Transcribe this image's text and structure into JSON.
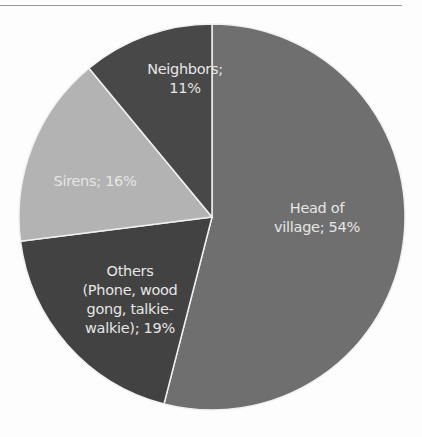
{
  "chart_data": {
    "type": "pie",
    "title": "",
    "categories": [
      "Head of village",
      "Others (Phone, wood gong, talkie-walkie)",
      "Sirens",
      "Neighbors"
    ],
    "values": [
      54,
      19,
      16,
      11
    ],
    "unit": "%",
    "colors": [
      "#6f6f6f",
      "#424242",
      "#b3b3b3",
      "#484848"
    ],
    "start_angle_deg": 0,
    "direction": "clockwise",
    "legend": "none",
    "data_labels": [
      "Head of village; 54%",
      "Others (Phone, wood gong, talkie-walkie); 19%",
      "Sirens; 16%",
      "Neighbors; 11%"
    ]
  },
  "labels": {
    "head": [
      "Head of",
      "village; 54%"
    ],
    "others": [
      "Others",
      "(Phone, wood",
      "gong, talkie-",
      "walkie); 19%"
    ],
    "sirens": [
      "Sirens; 16%"
    ],
    "neighbors": [
      "Neighbors;",
      "11%"
    ]
  }
}
